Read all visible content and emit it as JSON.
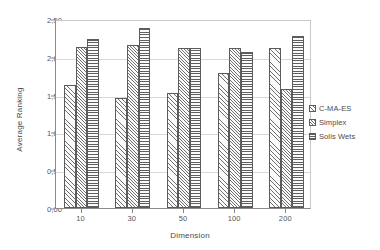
{
  "chart_data": {
    "type": "bar",
    "title": "",
    "xlabel": "Dimension",
    "ylabel": "Average Ranking",
    "categories": [
      "10",
      "30",
      "50",
      "100",
      "200"
    ],
    "series": [
      {
        "name": "C-MA-ES",
        "values": [
          1.63,
          1.46,
          1.52,
          1.79,
          2.12
        ]
      },
      {
        "name": "Simplex",
        "values": [
          2.13,
          2.15,
          2.12,
          2.12,
          1.57
        ]
      },
      {
        "name": "Solis Wets",
        "values": [
          2.24,
          2.38,
          2.12,
          2.06,
          2.27
        ]
      }
    ],
    "ylim": [
      0,
      2.5
    ],
    "ytick_values": [
      0,
      0.5,
      1.0,
      1.5,
      2.0,
      2.5
    ],
    "ytick_labels": [
      "0,00",
      "0,50",
      "1,00",
      "1,50",
      "2,00",
      "2,50"
    ],
    "grid": true,
    "grid_axis": "y",
    "legend_position": "right",
    "decimal_separator": ",",
    "colors": {
      "bar_fill": "#fbfbfb",
      "bar_edge": "#5b5b5b",
      "hatch": "#6f6f6f",
      "grid": "#d8d8d8",
      "axis": "#8a8a8a",
      "text": "#4a4a4a",
      "background": "#ffffff"
    }
  }
}
